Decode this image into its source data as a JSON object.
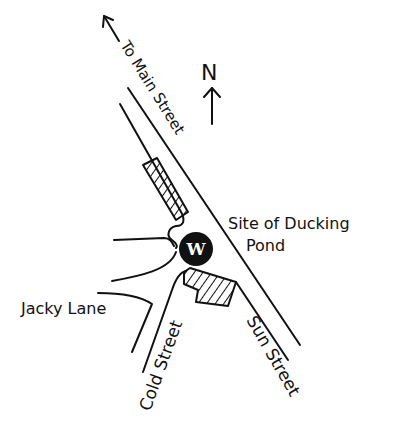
{
  "map": {
    "title": "",
    "north_label": "N",
    "labels": {
      "to_main_street": "To Main Street",
      "site": "Site of Ducking",
      "site_line2": "Pond",
      "jacky_lane": "Jacky Lane",
      "cold_street": "Cold Street",
      "sun_street": "Sun Street"
    },
    "marker": {
      "letter": "W",
      "color": "#111111"
    },
    "buildings": [
      {
        "name": "building-north",
        "style": "hatched"
      },
      {
        "name": "building-south",
        "style": "hatched"
      }
    ]
  }
}
